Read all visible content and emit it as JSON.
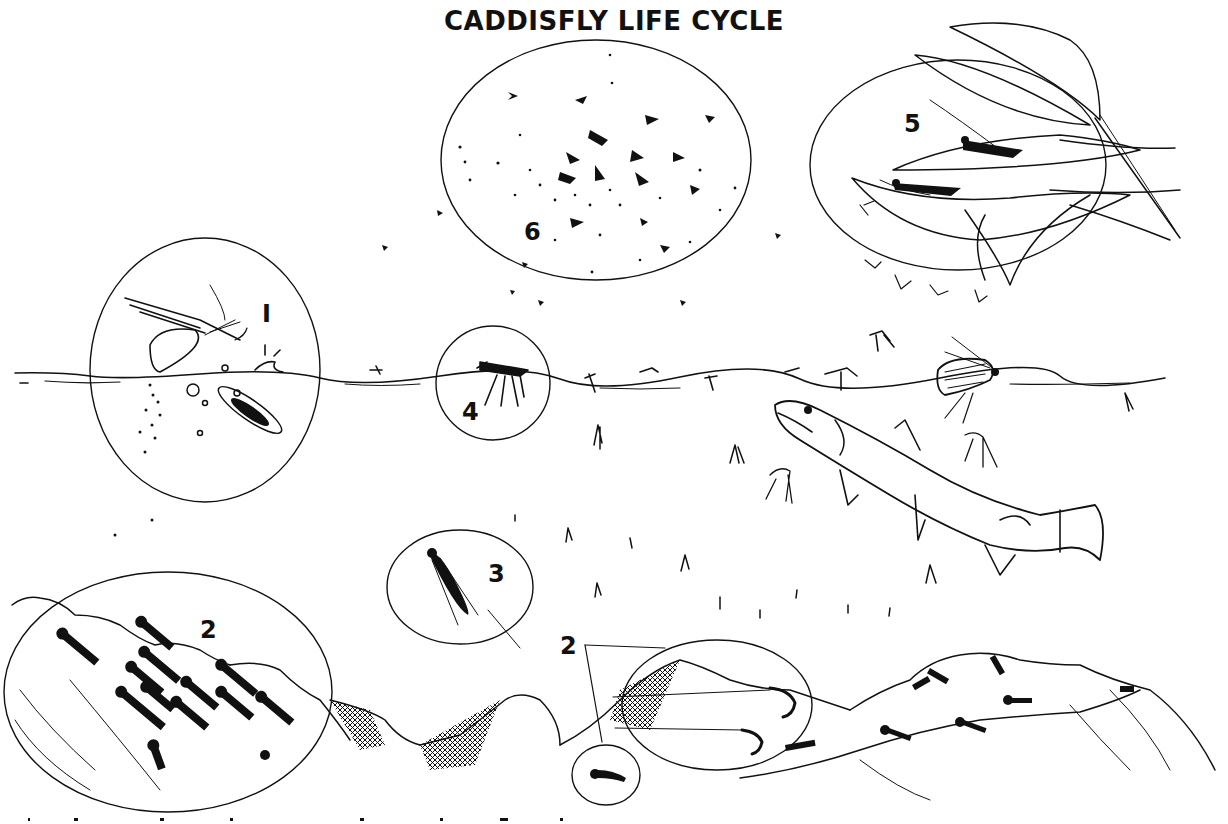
{
  "title": "CADDISFLY LIFE CYCLE",
  "colors": {
    "ink": "#111111",
    "background": "#ffffff"
  },
  "stages": [
    {
      "number": "1",
      "label_id": "stage-1",
      "depiction": "adult female caddisfly dipping at water surface laying eggs; egg mass sinking"
    },
    {
      "number": "2",
      "label_id": "stage-2-left",
      "depiction": "cased larvae crawling on streambed rocks"
    },
    {
      "number": "2",
      "label_id": "stage-2-right",
      "depiction": "net-spinning larvae with silk nets between rocks; free-living larva inset"
    },
    {
      "number": "3",
      "label_id": "stage-3",
      "depiction": "pupa ascending through the water column"
    },
    {
      "number": "4",
      "label_id": "stage-4",
      "depiction": "adult emerging at the water surface"
    },
    {
      "number": "5",
      "label_id": "stage-5",
      "depiction": "adults resting on streamside leaves"
    },
    {
      "number": "6",
      "label_id": "stage-6",
      "depiction": "adult mating swarm in the air"
    }
  ],
  "scene": {
    "fish": "spotted trout rising to feed on emerging pupae",
    "water_surface": "horizontal waterline across the middle",
    "streambed": "rocks along the bottom"
  },
  "caption": {
    "text": "",
    "note": "cropped italic caption at bottom edge, illegible"
  }
}
